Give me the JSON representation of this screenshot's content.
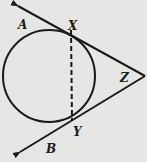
{
  "diagram": {
    "type": "geometry",
    "colors": {
      "background": "#e6e6e4",
      "stroke": "#1a1a1a"
    },
    "labels": {
      "A": "A",
      "X": "X",
      "Z": "Z",
      "Y": "Y",
      "B": "B"
    },
    "elements": {
      "circle": {
        "cx": 49,
        "cy": 76,
        "r": 46
      },
      "tangent_upper": {
        "from": "Z",
        "through": "X",
        "toward": "A",
        "arrow": true
      },
      "tangent_lower": {
        "from": "Z",
        "through": "Y",
        "toward": "B",
        "arrow": true
      },
      "chord": {
        "from": "X",
        "to": "Y",
        "style": "dashed"
      }
    }
  }
}
